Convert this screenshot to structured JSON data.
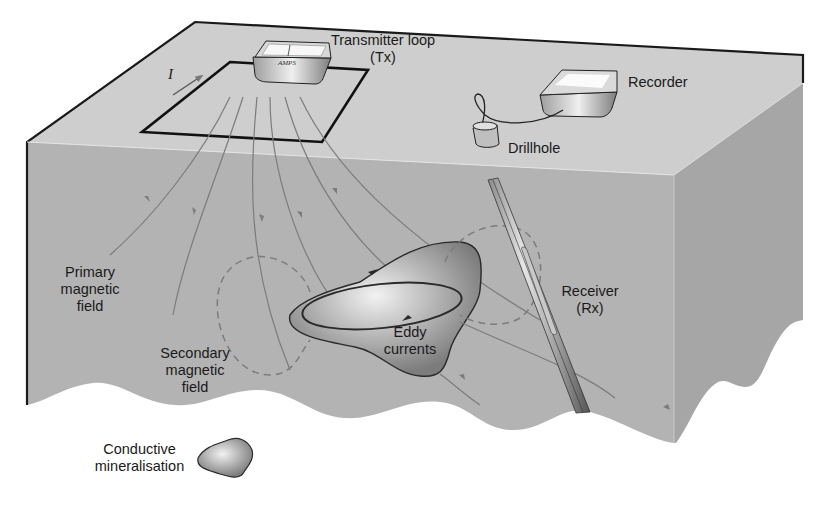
{
  "diagram": {
    "type": "borehole electromagnetic survey schematic",
    "colors": {
      "top_face": "#cecece",
      "front_face": "#b3b3b3",
      "right_face": "#a6a6a6",
      "outline": "#1a1a1a",
      "field_lines": "#7a7a7a",
      "ore_body": "#8e8e8e",
      "background": "#ffffff"
    },
    "labels": {
      "transmitter": {
        "line1": "Transmitter loop",
        "line2": "(Tx)"
      },
      "recorder": "Recorder",
      "drillhole": "Drillhole",
      "receiver": {
        "line1": "Receiver",
        "line2": "(Rx)"
      },
      "primary_field": {
        "line1": "Primary",
        "line2": "magnetic",
        "line3": "field"
      },
      "secondary_field": {
        "line1": "Secondary",
        "line2": "magnetic",
        "line3": "field"
      },
      "eddy_currents": {
        "line1": "Eddy",
        "line2": "currents"
      },
      "legend_mineralisation": {
        "line1": "Conductive",
        "line2": "mineralisation"
      },
      "current_symbol": "I",
      "transmitter_device_text": "AMPS"
    }
  }
}
